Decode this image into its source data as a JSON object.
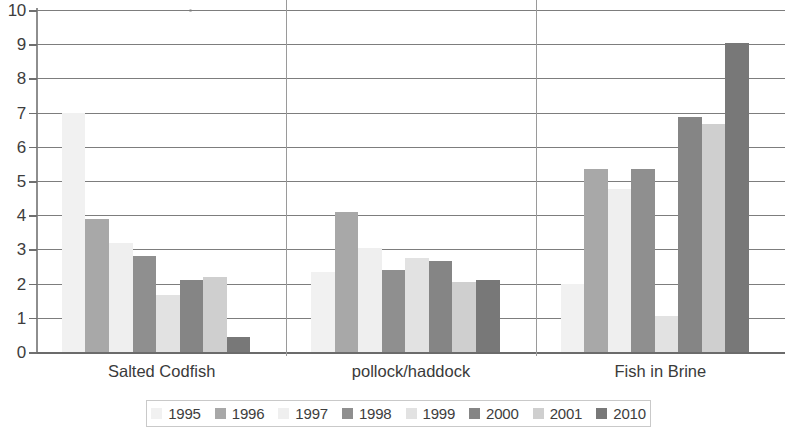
{
  "chart_data": {
    "type": "bar",
    "title": "",
    "subtitle": "",
    "xlabel": "",
    "ylabel": "",
    "ylim": [
      0,
      10
    ],
    "y_ticks": [
      0,
      1,
      2,
      3,
      4,
      5,
      6,
      7,
      8,
      9,
      10
    ],
    "y_tick_labels": [
      "0",
      "1",
      "2",
      "3",
      "4",
      "5",
      "6",
      "7",
      "8",
      "9",
      "10"
    ],
    "grid": true,
    "grid_axis": "y",
    "legend_position": "bottom",
    "categories": [
      "Salted Codfish",
      "pollock/haddock",
      "Fish in Brine"
    ],
    "series": [
      {
        "name": "1995",
        "color": "#f1f1f1",
        "values": [
          6.98,
          2.35,
          2.0
        ]
      },
      {
        "name": "1996",
        "color": "#a8a8a8",
        "values": [
          3.9,
          4.08,
          5.35
        ]
      },
      {
        "name": "1997",
        "color": "#efefef",
        "values": [
          3.2,
          3.05,
          4.78
        ]
      },
      {
        "name": "1998",
        "color": "#8f8f8f",
        "values": [
          2.82,
          2.4,
          5.35
        ]
      },
      {
        "name": "1999",
        "color": "#e2e2e2",
        "values": [
          1.68,
          2.75,
          1.05
        ]
      },
      {
        "name": "2000",
        "color": "#858585",
        "values": [
          2.1,
          2.65,
          6.88
        ]
      },
      {
        "name": "2001",
        "color": "#cfcfcf",
        "values": [
          2.18,
          2.05,
          6.68
        ]
      },
      {
        "name": "2010",
        "color": "#787878",
        "values": [
          0.45,
          2.1,
          9.05
        ]
      }
    ]
  },
  "legend": {
    "items": [
      {
        "label": "1995",
        "color": "#f1f1f1"
      },
      {
        "label": "1996",
        "color": "#a8a8a8"
      },
      {
        "label": "1997",
        "color": "#efefef"
      },
      {
        "label": "1998",
        "color": "#8f8f8f"
      },
      {
        "label": "1999",
        "color": "#e2e2e2"
      },
      {
        "label": "2000",
        "color": "#858585"
      },
      {
        "label": "2001",
        "color": "#cfcfcf"
      },
      {
        "label": "2010",
        "color": "#787878"
      }
    ]
  },
  "axis": {
    "y_tick_labels": [
      "10",
      "9",
      "8",
      "7",
      "6",
      "5",
      "4",
      "3",
      "2",
      "1",
      "0"
    ]
  },
  "colors": {
    "gridline": "#7d7d7d",
    "axis": "#8e8e8e",
    "text": "#3a3a3a",
    "background": "#ffffff"
  }
}
